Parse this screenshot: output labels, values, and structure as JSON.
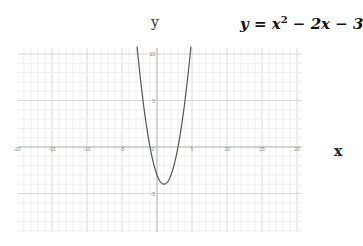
{
  "chart_data": {
    "type": "line",
    "xlabel": "x",
    "ylabel": "y",
    "xlim": [
      -20,
      20
    ],
    "ylim": [
      -9,
      11
    ],
    "grid": true,
    "x_ticks": [
      "-20",
      "-15",
      "-10",
      "-5",
      "0",
      "5",
      "10",
      "15",
      "20"
    ],
    "y_ticks": [
      "10",
      "5",
      "-5"
    ],
    "series": [
      {
        "name": "y = x^2 - 2x - 3",
        "color": "#555555",
        "x": [
          -2.9,
          -2,
          -1,
          0,
          1,
          2,
          3,
          4,
          4.9
        ],
        "y": [
          11.21,
          5,
          0,
          -3,
          -4,
          -3,
          0,
          5,
          11.21
        ]
      }
    ],
    "vertex": [
      1,
      -4
    ]
  },
  "labels": {
    "y_axis": "y",
    "x_axis": "x",
    "equation_prefix": "y = x",
    "equation_exp": "2",
    "equation_suffix": " − 2x − 3"
  }
}
